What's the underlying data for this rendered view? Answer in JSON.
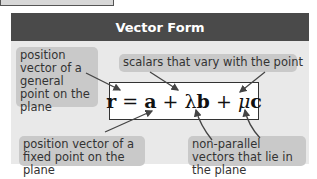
{
  "title": "Vector Form",
  "equation": {
    "text": "r = a + λb + μc"
  },
  "labels": {
    "general_point": "position vector of a general point on the plane",
    "scalars": "scalars that vary with the point",
    "fixed_point": "position vector of a fixed point on the plane",
    "non_parallel": "non-parallel vectors that lie in the plane"
  },
  "colors": {
    "header": "#4a4a4a",
    "panel": "#e9e9e9",
    "note": "#c9c9c9"
  }
}
